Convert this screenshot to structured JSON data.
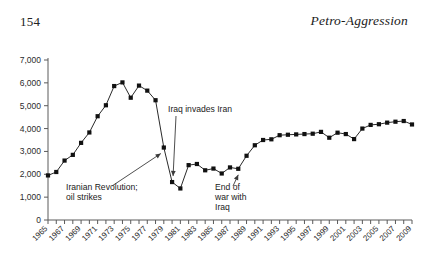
{
  "header": {
    "page_number": "154",
    "book_title": "Petro-Aggression"
  },
  "chart_data": {
    "type": "line",
    "title": "",
    "subtitle": "",
    "xlabel": "",
    "ylabel": "",
    "grid": false,
    "legend": "none",
    "marker": "filled-square",
    "xlim": [
      1965,
      2009
    ],
    "ylim": [
      0,
      7000
    ],
    "ytick_step": 1000,
    "ytick_labels": [
      "0",
      "1,000",
      "2,000",
      "3,000",
      "4,000",
      "5,000",
      "6,000",
      "7,000"
    ],
    "ytick_values": [
      0,
      1000,
      2000,
      3000,
      4000,
      5000,
      6000,
      7000
    ],
    "xtick_labels": [
      "1965",
      "1967",
      "1969",
      "1971",
      "1973",
      "1975",
      "1977",
      "1979",
      "1981",
      "1983",
      "1985",
      "1987",
      "1989",
      "1991",
      "1993",
      "1995",
      "1997",
      "1999",
      "2001",
      "2003",
      "2005",
      "2007",
      "2009"
    ],
    "xtick_label_rotation_deg": 45,
    "xtick_minor_every_year": true,
    "x": [
      1965,
      1966,
      1967,
      1968,
      1969,
      1970,
      1971,
      1972,
      1973,
      1974,
      1975,
      1976,
      1977,
      1978,
      1979,
      1980,
      1981,
      1982,
      1983,
      1984,
      1985,
      1986,
      1987,
      1988,
      1989,
      1990,
      1991,
      1992,
      1993,
      1994,
      1995,
      1996,
      1997,
      1998,
      1999,
      2000,
      2001,
      2002,
      2003,
      2004,
      2005,
      2006,
      2007,
      2008,
      2009
    ],
    "values": [
      1950,
      2100,
      2600,
      2850,
      3375,
      3830,
      4540,
      5020,
      5860,
      6020,
      5350,
      5880,
      5660,
      5240,
      3170,
      1660,
      1380,
      2400,
      2450,
      2175,
      2250,
      2035,
      2300,
      2240,
      2810,
      3270,
      3500,
      3530,
      3710,
      3730,
      3745,
      3760,
      3775,
      3855,
      3600,
      3820,
      3760,
      3540,
      4000,
      4160,
      4190,
      4260,
      4300,
      4330,
      4180
    ],
    "series": [
      {
        "name": "Iran oil production",
        "values": [
          1950,
          2100,
          2600,
          2850,
          3375,
          3830,
          4540,
          5020,
          5860,
          6020,
          5350,
          5880,
          5660,
          5240,
          3170,
          1660,
          1380,
          2400,
          2450,
          2175,
          2250,
          2035,
          2300,
          2240,
          2810,
          3270,
          3500,
          3530,
          3710,
          3730,
          3745,
          3760,
          3775,
          3855,
          3600,
          3820,
          3760,
          3540,
          4000,
          4160,
          4190,
          4260,
          4300,
          4330,
          4180
        ]
      }
    ],
    "annotations": [
      {
        "id": "iranian-revolution",
        "lines": [
          "Iranian Revolution;",
          "oil strikes"
        ],
        "points_to_year": 1979,
        "points_to_value": 3170
      },
      {
        "id": "iraq-invades-iran",
        "lines": [
          "Iraq invades Iran"
        ],
        "points_to_year": 1980,
        "points_to_value": 1660
      },
      {
        "id": "end-of-war-with-iraq",
        "lines": [
          "End of",
          "war with",
          "Iraq"
        ],
        "points_to_year": 1988,
        "points_to_value": 2240
      }
    ],
    "colors": {
      "marker": "#111111",
      "line": "#2a2a2a",
      "axis": "#5a5a5a",
      "text": "#1a1a1a",
      "background": "#ffffff"
    }
  }
}
